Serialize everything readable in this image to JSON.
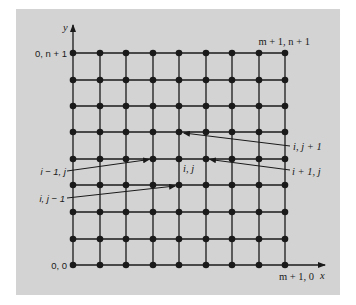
{
  "figure": {
    "background_color": "#d3d3d3",
    "line_color": "#1a1a1a",
    "axes": {
      "x_label": "x",
      "y_label": "y"
    },
    "grid": {
      "columns": 9,
      "rows": 9,
      "x_positions": [
        73,
        100,
        126,
        153,
        179,
        206,
        232,
        259,
        285
      ],
      "y_positions": [
        53,
        80,
        106,
        132,
        159,
        185,
        212,
        239,
        265
      ]
    },
    "corner_labels": {
      "top_left": "0, n + 1",
      "top_right": "m + 1, n + 1",
      "bottom_left": "0, 0",
      "bottom_right": "m + 1, 0"
    },
    "node_labels": {
      "center": "i, j",
      "up": "i, j + 1",
      "right": "i + 1, j",
      "left": "i − 1, j",
      "down": "i, j − 1"
    }
  }
}
